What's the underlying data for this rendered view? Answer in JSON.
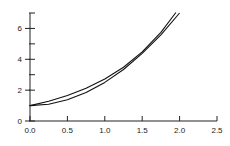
{
  "chart_data": {
    "type": "line",
    "title": "",
    "xlabel": "",
    "ylabel": "",
    "xlim": [
      0,
      2.5
    ],
    "ylim": [
      0,
      7
    ],
    "x_ticks": [
      "0.0",
      "0.5",
      "1.0",
      "1.5",
      "2.0",
      "2.5"
    ],
    "y_ticks": [
      "0",
      "2",
      "4",
      "6"
    ],
    "grid": false,
    "legend": null,
    "series": [
      {
        "name": "curve-1",
        "x": [
          0,
          0.25,
          0.5,
          0.75,
          1.0,
          1.25,
          1.5,
          1.75,
          1.95
        ],
        "values": [
          1.0,
          1.28,
          1.65,
          2.12,
          2.72,
          3.49,
          4.48,
          5.75,
          7.03
        ]
      },
      {
        "name": "curve-2",
        "x": [
          0,
          0.25,
          0.5,
          0.75,
          1.0,
          1.25,
          1.5,
          1.75,
          2.0
        ],
        "values": [
          1.0,
          1.09,
          1.38,
          1.84,
          2.5,
          3.34,
          4.38,
          5.59,
          7.0
        ]
      }
    ]
  }
}
